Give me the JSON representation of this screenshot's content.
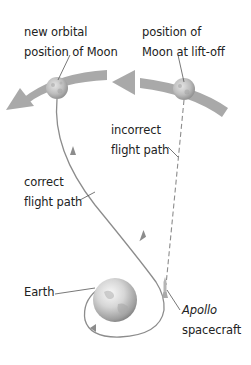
{
  "labels": {
    "new_moon": {
      "line1": "new orbital",
      "line2": "position of Moon"
    },
    "liftoff_moon": {
      "line1": "position of",
      "line2": "Moon at lift-off"
    },
    "incorrect_path": {
      "line1": "incorrect",
      "line2": "flight path"
    },
    "correct_path": {
      "line1": "correct",
      "line2": "flight path"
    },
    "earth": {
      "line1": "Earth"
    },
    "spacecraft": {
      "line1": "Apollo",
      "line2": "spacecraft"
    }
  },
  "colors": {
    "orbit_band": "#a9a9a9",
    "path_line": "#8c8c8c",
    "leader_line": "#555555",
    "text": "#222222"
  }
}
